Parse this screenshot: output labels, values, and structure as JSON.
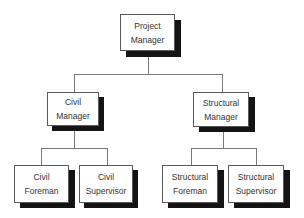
{
  "diagram": {
    "type": "org-chart",
    "colors": {
      "background": "#ffffff",
      "box_fill": "#ffffff",
      "box_border": "#5a5a5a",
      "shadow": "#141414",
      "connector": "#7a7a7a",
      "text": "#333333"
    },
    "nodes": {
      "project_manager": {
        "line1": "Project",
        "line2": "Manager"
      },
      "civil_manager": {
        "line1": "Civil",
        "line2": "Manager"
      },
      "structural_manager": {
        "line1": "Structural",
        "line2": "Manager"
      },
      "civil_foreman": {
        "line1": "Civil",
        "line2": "Foreman"
      },
      "civil_supervisor": {
        "line1": "Civil",
        "line2": "Supervisor"
      },
      "structural_foreman": {
        "line1": "Structural",
        "line2": "Foreman"
      },
      "structural_supervisor": {
        "line1": "Structural",
        "line2": "Supervisor"
      }
    },
    "edges": [
      {
        "from": "Project Manager",
        "to": "Civil Manager"
      },
      {
        "from": "Project Manager",
        "to": "Structural Manager"
      },
      {
        "from": "Civil Manager",
        "to": "Civil Foreman"
      },
      {
        "from": "Civil Manager",
        "to": "Civil Supervisor"
      },
      {
        "from": "Structural Manager",
        "to": "Structural Foreman"
      },
      {
        "from": "Structural Manager",
        "to": "Structural Supervisor"
      }
    ]
  }
}
